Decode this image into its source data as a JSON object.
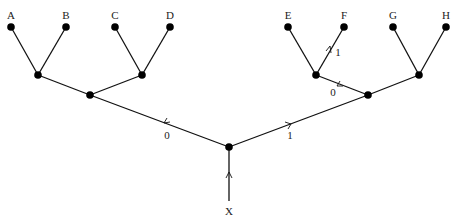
{
  "diagram": {
    "type": "binary-tree",
    "root_label": "X",
    "leaves": [
      "A",
      "B",
      "C",
      "D",
      "E",
      "F",
      "G",
      "H"
    ],
    "edge_labels": {
      "root_left": "0",
      "root_right": "1",
      "right_left": "0",
      "ef_right": "1"
    },
    "path_highlighted": "X → 1 → 0 → 1 → F"
  }
}
